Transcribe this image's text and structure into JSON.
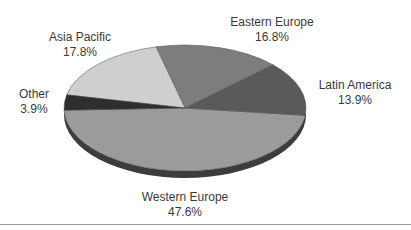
{
  "chart_data": {
    "type": "pie",
    "title": "",
    "style": "3d",
    "categories": [
      "Western Europe",
      "Latin America",
      "Eastern Europe",
      "Asia Pacific",
      "Other"
    ],
    "values": [
      47.6,
      13.9,
      16.8,
      17.8,
      3.9
    ],
    "unit": "%",
    "colors": [
      "#9b9b9b",
      "#5a5a5a",
      "#7d7d7d",
      "#cfcfcf",
      "#2e2e2e"
    ],
    "legend": "none (direct labels)"
  },
  "labels": {
    "western_europe": {
      "name": "Western Europe",
      "value": "47.6%"
    },
    "latin_america": {
      "name": "Latin America",
      "value": "13.9%"
    },
    "eastern_europe": {
      "name": "Eastern Europe",
      "value": "16.8%"
    },
    "asia_pacific": {
      "name": "Asia Pacific",
      "value": "17.8%"
    },
    "other": {
      "name": "Other",
      "value": "3.9%"
    }
  }
}
